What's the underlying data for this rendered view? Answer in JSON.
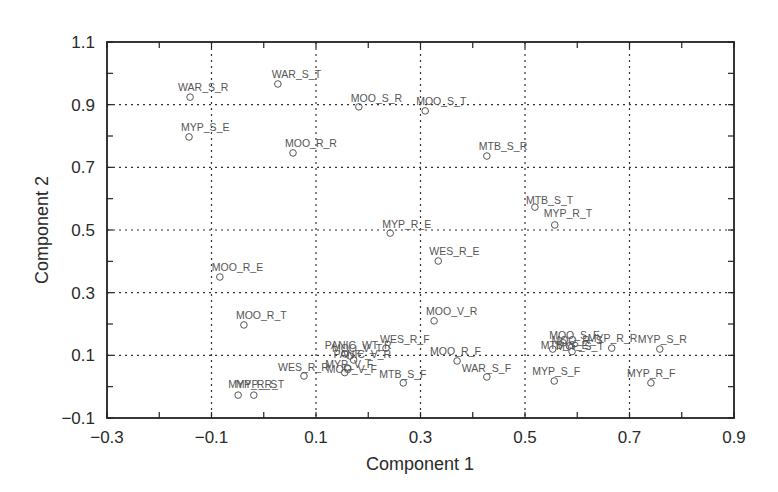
{
  "chart_data": {
    "type": "scatter",
    "title": "",
    "xlabel": "Component 1",
    "ylabel": "Component 2",
    "xlim": [
      -0.3,
      0.9
    ],
    "ylim": [
      -0.1,
      1.1
    ],
    "xticks": [
      -0.3,
      -0.1,
      0.1,
      0.3,
      0.5,
      0.7,
      0.9
    ],
    "yticks": [
      -0.1,
      0.1,
      0.3,
      0.5,
      0.7,
      0.9,
      1.1
    ],
    "xtick_labels": [
      "−0.3",
      "−0.1",
      "0.1",
      "0.3",
      "0.5",
      "0.7",
      "0.9"
    ],
    "ytick_labels": [
      "−0.1",
      "0.1",
      "0.3",
      "0.5",
      "0.7",
      "0.9",
      "1.1"
    ],
    "grid": true,
    "legend": null,
    "marker": "open-circle",
    "points": [
      {
        "label": "WAR_S_R",
        "x": -0.141,
        "y": 0.924,
        "lx": -12,
        "ly": -6
      },
      {
        "label": "WAR_S_T",
        "x": 0.027,
        "y": 0.966,
        "lx": -6,
        "ly": -6
      },
      {
        "label": "MOO_S_R",
        "x": 0.182,
        "y": 0.893,
        "lx": -8,
        "ly": -5
      },
      {
        "label": "MOO_S_T",
        "x": 0.309,
        "y": 0.88,
        "lx": -9,
        "ly": -6
      },
      {
        "label": "MYP_S_E",
        "x": -0.143,
        "y": 0.797,
        "lx": -8,
        "ly": -6
      },
      {
        "label": "MOO_R_R",
        "x": 0.056,
        "y": 0.746,
        "lx": -8,
        "ly": -6
      },
      {
        "label": "MTB_S_R",
        "x": 0.427,
        "y": 0.736,
        "lx": -8,
        "ly": -6
      },
      {
        "label": "MTB_S_T",
        "x": 0.519,
        "y": 0.573,
        "lx": -9,
        "ly": -3
      },
      {
        "label": "MYP_R_T",
        "x": 0.557,
        "y": 0.516,
        "lx": -11,
        "ly": -8
      },
      {
        "label": "MYP_R_E",
        "x": 0.242,
        "y": 0.49,
        "lx": -8,
        "ly": -5
      },
      {
        "label": "WES_R_E",
        "x": 0.334,
        "y": 0.401,
        "lx": -9,
        "ly": -6
      },
      {
        "label": "MOO_R_E",
        "x": -0.084,
        "y": 0.35,
        "lx": -8,
        "ly": -6
      },
      {
        "label": "MOO_R_T",
        "x": -0.038,
        "y": 0.197,
        "lx": -8,
        "ly": -6
      },
      {
        "label": "MOO_V_R",
        "x": 0.326,
        "y": 0.21,
        "lx": -8,
        "ly": -6
      },
      {
        "label": "WES_R_F",
        "x": 0.234,
        "y": 0.123,
        "lx": -6,
        "ly": -5
      },
      {
        "label": "PANIC_WT_R",
        "x": 0.155,
        "y": 0.105,
        "lx": -20,
        "ly": -5
      },
      {
        "label": "MOO_V_T",
        "x": 0.165,
        "y": 0.098,
        "lx": -18,
        "ly": -4
      },
      {
        "label": "PANIC_V_R",
        "x": 0.172,
        "y": 0.085,
        "lx": -20,
        "ly": -2
      },
      {
        "label": "MYP_V_F",
        "x": 0.16,
        "y": 0.06,
        "lx": -22,
        "ly": 0
      },
      {
        "label": "MOO_V_F",
        "x": 0.155,
        "y": 0.045,
        "lx": -18,
        "ly": 0
      },
      {
        "label": "WES_R_R",
        "x": 0.077,
        "y": 0.034,
        "lx": -26,
        "ly": -5
      },
      {
        "label": "MTB_S_F",
        "x": 0.267,
        "y": 0.012,
        "lx": -24,
        "ly": -5
      },
      {
        "label": "MOO_R_F",
        "x": 0.37,
        "y": 0.082,
        "lx": -27,
        "ly": -6
      },
      {
        "label": "WAR_S_F",
        "x": 0.427,
        "y": 0.031,
        "lx": -25,
        "ly": -5
      },
      {
        "label": "MOO_S_F",
        "x": 0.573,
        "y": 0.14,
        "lx": -14,
        "ly": -4
      },
      {
        "label": "MOO_R_S",
        "x": 0.585,
        "y": 0.13,
        "lx": -18,
        "ly": -2
      },
      {
        "label": "MYP_S_T",
        "x": 0.59,
        "y": 0.112,
        "lx": -16,
        "ly": -2
      },
      {
        "label": "MTB_S_E",
        "x": 0.553,
        "y": 0.12,
        "lx": -12,
        "ly": 0
      },
      {
        "label": "MYP_R_R",
        "x": 0.666,
        "y": 0.123,
        "lx": -24,
        "ly": -6
      },
      {
        "label": "MYP_S_R",
        "x": 0.758,
        "y": 0.12,
        "lx": -22,
        "ly": -6
      },
      {
        "label": "MYP_S_F",
        "x": 0.556,
        "y": 0.018,
        "lx": -22,
        "ly": -6
      },
      {
        "label": "MYP_R_F",
        "x": 0.741,
        "y": 0.012,
        "lx": -24,
        "ly": -6
      },
      {
        "label": "MYP_R_S",
        "x": -0.049,
        "y": -0.027,
        "lx": -10,
        "ly": -7
      },
      {
        "label": "MYP_R_T",
        "x": -0.019,
        "y": -0.027,
        "lx": -18,
        "ly": -7
      }
    ]
  }
}
